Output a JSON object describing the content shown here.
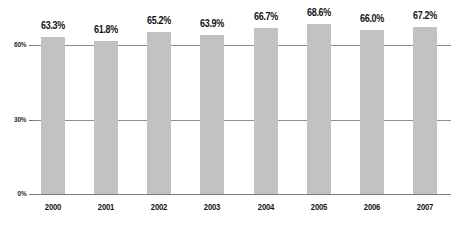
{
  "chart_data": {
    "type": "bar",
    "title": "",
    "subtitle": "",
    "xlabel": "",
    "ylabel": "",
    "categories": [
      "2000",
      "2001",
      "2002",
      "2003",
      "2004",
      "2005",
      "2006",
      "2007"
    ],
    "values": [
      63.3,
      61.8,
      65.2,
      63.9,
      66.7,
      68.6,
      66.0,
      67.2
    ],
    "data_labels": [
      "63.3%",
      "61.8%",
      "65.2%",
      "63.9%",
      "66.7%",
      "68.6%",
      "66.0%",
      "67.2%"
    ],
    "ylim": [
      0,
      75
    ],
    "yticks": [
      0,
      30,
      60
    ],
    "ytick_labels": [
      "0%",
      "30%",
      "60%"
    ],
    "grid": true,
    "grid_axis": "y",
    "legend": false,
    "legend_position": "none",
    "series": [
      {
        "name": "",
        "values": [
          63.3,
          61.8,
          65.2,
          63.9,
          66.7,
          68.6,
          66.0,
          67.2
        ],
        "color": "#c2c2c2"
      }
    ],
    "colors": {
      "bar_fill": "#c2c2c2",
      "gridline": "#8d8d8d",
      "axis": "#7a7a7a",
      "label_text": "#141414",
      "background": "#ffffff"
    }
  }
}
